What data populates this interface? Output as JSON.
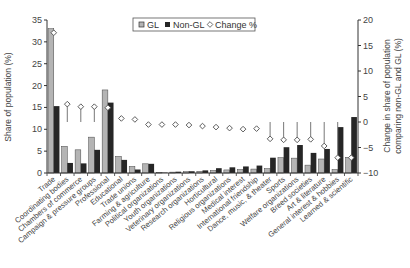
{
  "chart_data": {
    "type": "bar",
    "title": "",
    "xlabel": "",
    "ylabel": "Share of population (%)",
    "y2label_line1": "Change in share of population",
    "y2label_line2": "comparing non-GL and GL (%)",
    "ylim": [
      0,
      35
    ],
    "y2lim": [
      -10,
      20
    ],
    "yticks": [
      0,
      5,
      10,
      15,
      20,
      25,
      30,
      35
    ],
    "y2ticks": [
      -10,
      -5,
      0,
      5,
      10,
      15,
      20
    ],
    "legend": [
      "GL",
      "Non-GL",
      "Change %"
    ],
    "legend_position": "top-center",
    "grid": false,
    "categories": [
      "Trade",
      "Coordinating bodies",
      "Chambers of commerce",
      "Campaign & pressure groups",
      "Professional",
      "Educational",
      "Trade unions",
      "Farming & agriculture",
      "Political organizations",
      "Youth organizations",
      "Veterinary organizations",
      "Research organizations",
      "Horticultural",
      "Religious organizations",
      "Medical interest",
      "International friendship",
      "Dance, music, & theater",
      "Sports",
      "Welfare organizations",
      "Breed societies",
      "Art & literature",
      "General interest & hobbies",
      "Learned & scientific"
    ],
    "series": [
      {
        "name": "GL",
        "axis": "left",
        "type": "bar",
        "color": "#b4b4b4",
        "values": [
          33.0,
          6.1,
          5.3,
          8.2,
          19.0,
          3.8,
          1.5,
          2.1,
          0.1,
          0.2,
          0.3,
          0.4,
          0.6,
          0.7,
          0.8,
          0.9,
          1.0,
          3.5,
          3.4,
          1.8,
          3.2,
          0.8,
          3.6
        ]
      },
      {
        "name": "Non-GL",
        "axis": "left",
        "type": "bar",
        "color": "#262626",
        "values": [
          15.3,
          2.3,
          2.2,
          5.3,
          16.1,
          3.0,
          0.8,
          2.1,
          0.1,
          0.3,
          0.4,
          0.6,
          1.1,
          1.3,
          1.5,
          1.7,
          3.5,
          5.9,
          6.4,
          4.6,
          5.5,
          10.5,
          12.8
        ]
      },
      {
        "name": "Change %",
        "axis": "right",
        "type": "marker",
        "color": "#ffffff",
        "values": [
          17.5,
          3.5,
          3.0,
          3.0,
          2.8,
          0.7,
          0.5,
          -0.5,
          -0.5,
          -0.5,
          -0.6,
          -0.8,
          -1.0,
          -1.2,
          -1.4,
          -1.3,
          -3.3,
          -3.5,
          -3.5,
          -3.4,
          -4.7,
          -7.0,
          -7.0
        ]
      }
    ],
    "change_stems_from_zero": [
      false,
      true,
      true,
      true,
      false,
      false,
      false,
      false,
      false,
      false,
      false,
      false,
      false,
      false,
      false,
      false,
      true,
      true,
      true,
      true,
      true,
      true,
      false
    ]
  },
  "colors": {
    "gl": "#b4b4b4",
    "nongl": "#262626",
    "axis": "#333333",
    "stem": "#777777"
  }
}
